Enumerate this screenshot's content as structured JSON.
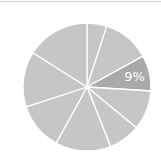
{
  "chart_data": {
    "type": "pie",
    "title": "",
    "start_angle_deg": 0,
    "direction": "clockwise",
    "categories": [
      "Slice 1",
      "Slice 2",
      "Slice 3",
      "Slice 4",
      "Slice 5",
      "Slice 6",
      "Slice 7",
      "Slice 8",
      "Slice 9"
    ],
    "values": [
      5,
      12,
      9,
      10,
      8,
      14,
      12,
      14,
      16
    ],
    "highlighted_index": 2,
    "annotations": [
      {
        "slice_index": 2,
        "text": "9%"
      }
    ],
    "legend": null
  },
  "colors": {
    "slice_fill": "#c6c6c6",
    "highlight_fill": "#a9a9a9",
    "separator": "#ffffff",
    "label_text": "#ffffff",
    "top_border": "#cfcfcf"
  },
  "geometry": {
    "cx": 87,
    "cy": 87,
    "r": 64
  }
}
